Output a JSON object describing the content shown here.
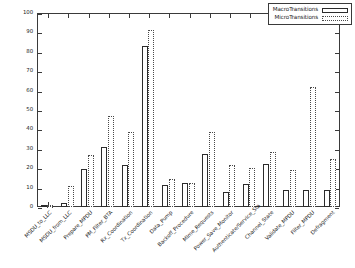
{
  "chart_data": {
    "type": "bar",
    "title": "",
    "xlabel": "",
    "ylabel": "",
    "ylim": [
      0,
      100
    ],
    "yticks": [
      0,
      10,
      20,
      30,
      40,
      50,
      60,
      70,
      80,
      90,
      100
    ],
    "grid": false,
    "legend_position": "top-right",
    "categories": [
      "MSDU_to_LLC",
      "MSDU_from_LLC",
      "Prepare_MPDU",
      "PM_Filter_BTA",
      "Rx_Coordination",
      "Tx_Coordination",
      "Data_Pump",
      "Backoff_Procedure",
      "Mlme_Requests",
      "Power_Save_Monitor",
      "Authenticate/Service_Sta",
      "Channel_State",
      "Validate_MPDU",
      "Filter_MPDU",
      "Defragment"
    ],
    "series": [
      {
        "name": "MacroTransitions",
        "style": "solid",
        "values": [
          1,
          2,
          19.5,
          31,
          21.5,
          83,
          11.5,
          12.5,
          27.5,
          7.5,
          12,
          22,
          9,
          9,
          9
        ]
      },
      {
        "name": "MicroTransitions",
        "style": "dotted",
        "values": [
          1,
          11,
          27,
          47,
          38.5,
          91.5,
          14.5,
          12.5,
          38.5,
          21.5,
          20,
          28.5,
          19,
          62,
          25
        ]
      }
    ]
  },
  "legend": {
    "entries": [
      {
        "label": "MacroTransitions",
        "key": "solid-outline-key"
      },
      {
        "label": "MicroTransitions",
        "key": "dotted-outline-key"
      }
    ]
  },
  "colors": {
    "axis": "#3a3a3a",
    "macro_outline": "#2b2b2b",
    "micro_outline": "#4a4a4a",
    "background": "#ffffff",
    "text": "#1c1c1c"
  }
}
